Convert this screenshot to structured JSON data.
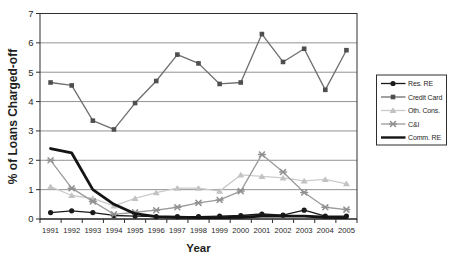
{
  "chart_data": {
    "type": "line",
    "title": "",
    "xlabel": "Year",
    "ylabel": "% of Loans Charged-off",
    "x_categories": [
      "1991",
      "1992",
      "1993",
      "1994",
      "1995",
      "1996",
      "1997",
      "1998",
      "1999",
      "2000",
      "2001",
      "2002",
      "2003",
      "2004",
      "2005"
    ],
    "ylim": [
      0,
      7
    ],
    "yticks": [
      0,
      1,
      2,
      3,
      4,
      5,
      6,
      7
    ],
    "grid": "horizontal-only",
    "legend_position": "middle-right-boxed",
    "background_color": "#ffffff",
    "grid_color": "#878787",
    "axis_color": "#2e2e2e",
    "text_color": "#1f1f1f",
    "series": [
      {
        "name": "Res. RE",
        "marker": "circle",
        "line_color": "#1a1a1a",
        "marker_color": "#1a1a1a",
        "line_width": 1.3,
        "values": [
          0.22,
          0.28,
          0.22,
          0.12,
          0.1,
          0.08,
          0.08,
          0.08,
          0.1,
          0.12,
          0.17,
          0.13,
          0.3,
          0.1,
          0.1
        ]
      },
      {
        "name": "Credit Card",
        "marker": "square",
        "line_color": "#6e6e6e",
        "marker_color": "#4f4f4f",
        "line_width": 1.3,
        "values": [
          4.65,
          4.55,
          3.35,
          3.05,
          3.95,
          4.7,
          5.6,
          5.3,
          4.6,
          4.65,
          6.3,
          5.35,
          5.8,
          4.4,
          5.75
        ]
      },
      {
        "name": "Oth. Cons.",
        "marker": "triangle",
        "line_color": "#cbcbcb",
        "marker_color": "#c2c2c2",
        "line_width": 1.3,
        "values": [
          1.1,
          0.8,
          0.7,
          0.45,
          0.7,
          0.9,
          1.05,
          1.05,
          0.95,
          1.5,
          1.45,
          1.4,
          1.3,
          1.35,
          1.2
        ]
      },
      {
        "name": "C&I",
        "marker": "star",
        "line_color": "#9b9b9b",
        "marker_color": "#919191",
        "line_width": 1.3,
        "values": [
          2.0,
          1.05,
          0.6,
          0.16,
          0.23,
          0.3,
          0.4,
          0.55,
          0.65,
          0.95,
          2.2,
          1.6,
          0.9,
          0.4,
          0.32
        ]
      },
      {
        "name": "Comm. RE",
        "marker": "none",
        "line_color": "#141414",
        "marker_color": "#141414",
        "line_width": 2.8,
        "values": [
          2.4,
          2.25,
          1.0,
          0.5,
          0.18,
          0.08,
          0.06,
          0.05,
          0.05,
          0.06,
          0.1,
          0.1,
          0.1,
          0.06,
          0.05
        ]
      }
    ]
  }
}
